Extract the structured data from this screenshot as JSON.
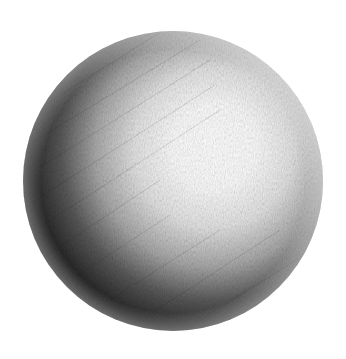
{
  "image": {
    "subject": "pencil-shaded sphere",
    "background": "#ffffff",
    "sphere": {
      "cx": 173,
      "cy": 181,
      "r": 150,
      "highlight": {
        "cx": 225,
        "cy": 148
      },
      "colors": {
        "highlight": "#ffffff",
        "midtone": "#b8b8b8",
        "shadow": "#2a2a2a",
        "core_shadow": "#141414",
        "reflected_light": "#3c3c3c"
      }
    }
  }
}
